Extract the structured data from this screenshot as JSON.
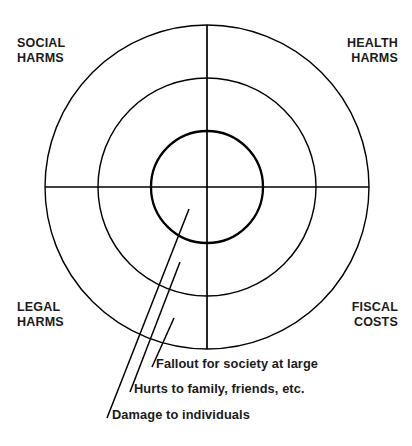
{
  "diagram": {
    "type": "concentric-rings-quadrant",
    "background_color": "#ffffff",
    "line_color": "#000000",
    "center": {
      "x": 207,
      "y": 187
    },
    "rings": [
      {
        "name": "outer-ring",
        "radius": 162,
        "stroke_width": 1.4,
        "label": "Fallout for society at large"
      },
      {
        "name": "middle-ring",
        "radius": 109,
        "stroke_width": 1.4,
        "label": "Hurts to family, friends, etc."
      },
      {
        "name": "inner-ring",
        "radius": 56,
        "stroke_width": 2.2,
        "label": "Damage to individuals"
      }
    ],
    "axes": {
      "horizontal": {
        "x1": 45,
        "y1": 187,
        "x2": 369,
        "y2": 187
      },
      "vertical": {
        "x1": 207,
        "y1": 25,
        "x2": 207,
        "y2": 349
      }
    },
    "quadrant_labels": [
      {
        "id": "social",
        "line1": "SOCIAL",
        "line2": "HARMS",
        "text": "SOCIAL\nHARMS",
        "position": "top-left"
      },
      {
        "id": "health",
        "line1": "HEALTH",
        "line2": "HARMS",
        "text": "HEALTH\nHARMS",
        "position": "top-right"
      },
      {
        "id": "legal",
        "line1": "LEGAL",
        "line2": "HARMS",
        "text": "LEGAL\nHARMS",
        "position": "bottom-left"
      },
      {
        "id": "fiscal",
        "line1": "FISCAL",
        "line2": "COSTS",
        "text": "FISCAL\nCOSTS",
        "position": "bottom-right"
      }
    ],
    "callouts": [
      {
        "id": "society",
        "text": "Fallout for society at large",
        "leader_line": {
          "x1": 174,
          "y1": 318,
          "x2": 152,
          "y2": 366
        }
      },
      {
        "id": "family",
        "text": "Hurts to family, friends, etc.",
        "leader_line": {
          "x1": 180,
          "y1": 262,
          "x2": 130,
          "y2": 391
        }
      },
      {
        "id": "individuals",
        "text": "Damage to individuals",
        "leader_line": {
          "x1": 189,
          "y1": 209,
          "x2": 107,
          "y2": 417
        }
      }
    ]
  }
}
